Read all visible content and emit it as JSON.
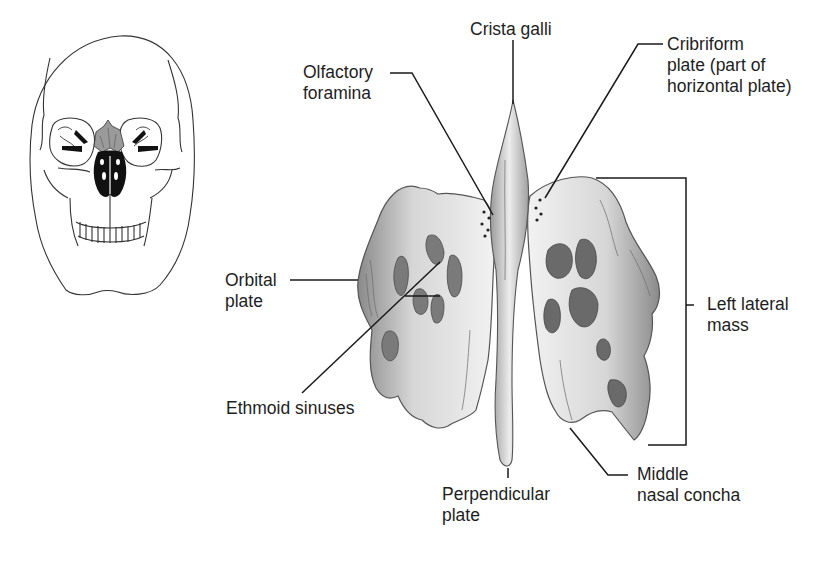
{
  "figure": {
    "skull_thumbnail": {
      "description": "Anterior view of skull with ethmoid bone highlighted",
      "highlight_color": "#9a9a9a",
      "outline_color": "#333333"
    },
    "main_illustration": {
      "description": "Anterior view of ethmoid bone",
      "bone_colors": {
        "light": "#efefef",
        "mid": "#b8b8b8",
        "dark": "#6e6e6e",
        "shadow": "#3c3c3c"
      }
    },
    "labels": {
      "olfactory_foramina": {
        "line1": "Olfactory",
        "line2": "foramina"
      },
      "crista_galli": {
        "line1": "Crista galli"
      },
      "cribriform_plate": {
        "line1": "Cribriform",
        "line2": "plate (part of",
        "line3": "horizontal plate)"
      },
      "orbital_plate": {
        "line1": "Orbital",
        "line2": "plate"
      },
      "ethmoid_sinuses": {
        "line1": "Ethmoid sinuses"
      },
      "left_lateral_mass": {
        "line1": "Left lateral",
        "line2": "mass"
      },
      "perpendicular_plate": {
        "line1": "Perpendicular",
        "line2": "plate"
      },
      "middle_nasal_concha": {
        "line1": "Middle",
        "line2": "nasal concha"
      }
    },
    "leader_line_color": "#1a1a1a"
  }
}
